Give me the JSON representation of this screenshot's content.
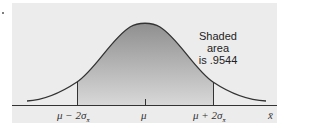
{
  "figure": {
    "annotation": {
      "line1": "Shaded area",
      "line2": "is .9544"
    },
    "axis": {
      "labels": [
        {
          "text": "μ − 2σ",
          "sub": "x̄"
        },
        {
          "text": "μ"
        },
        {
          "text": "μ + 2σ",
          "sub": "x̄"
        }
      ],
      "axis_label": "x̄"
    },
    "colors": {
      "background_panel": "#ececec",
      "shade_top": "#8f8f8f",
      "shade_bottom": "#d6d6d6",
      "curve": "#333333"
    }
  }
}
